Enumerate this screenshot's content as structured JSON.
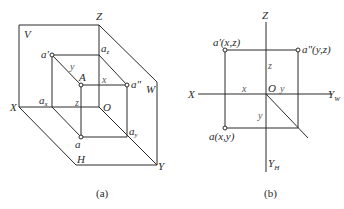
{
  "diagram_a": {
    "caption": "(a)",
    "planes": {
      "V": "V",
      "W": "W",
      "H": "H"
    },
    "axes": {
      "X": "X",
      "Y": "Y",
      "Z": "Z",
      "O": "O"
    },
    "points": {
      "a_prime": "a'",
      "a_z": "a",
      "a_z_sub": "z",
      "A": "A",
      "a_double_prime": "a\"",
      "a_x": "a",
      "a_x_sub": "x",
      "a": "a",
      "a_y": "a",
      "a_y_sub": "y"
    },
    "dims": {
      "x": "x",
      "y": "y",
      "z": "z"
    }
  },
  "diagram_b": {
    "caption": "(b)",
    "axes": {
      "X": "X",
      "Z": "Z",
      "O": "O",
      "Y_W": "Y",
      "Y_W_sub": "W",
      "Y_H": "Y",
      "Y_H_sub": "H"
    },
    "points": {
      "a_prime": "a'(x,z)",
      "a_double_prime": "a\"(y,z)",
      "a": "a(x,y)"
    },
    "dims": {
      "x": "x",
      "y_w": "y",
      "y_h": "y",
      "z": "z"
    }
  },
  "colors": {
    "line": "#2a2a2a",
    "background": "#ffffff"
  }
}
